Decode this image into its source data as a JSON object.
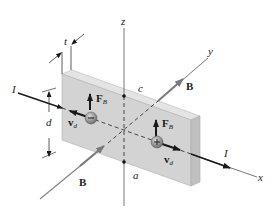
{
  "figure": {
    "colors": {
      "slab_front": "#d4d4d4",
      "slab_top": "#e6e6e6",
      "slab_side": "#c2c2c2",
      "axis": "#555555",
      "arrow_dark": "#1a1a1a",
      "b_field_arrow": "#7a7a7a",
      "charge_fill": "#8c8c8c"
    },
    "axes": {
      "x": "x",
      "y": "y",
      "z": "z"
    },
    "labels": {
      "current_left": "I",
      "current_right": "I",
      "b_field_top": "B",
      "b_field_bottom": "B",
      "force_left_main": "F",
      "force_left_sub": "B",
      "force_right_main": "F",
      "force_right_sub": "B",
      "velocity_left_main": "v",
      "velocity_left_sub": "d",
      "velocity_right_main": "v",
      "velocity_right_sub": "d",
      "thickness": "t",
      "height": "d",
      "point_top": "c",
      "point_bottom": "a"
    },
    "charges": {
      "left": "−",
      "right": "+"
    }
  }
}
